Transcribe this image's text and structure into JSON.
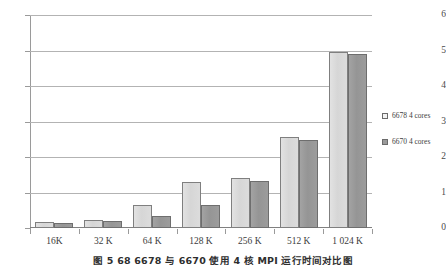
{
  "chart_data": {
    "type": "bar",
    "title": "",
    "subtitle": "",
    "xlabel": "",
    "ylabel": "",
    "ylim": [
      0,
      6
    ],
    "yticks": [
      0,
      1,
      2,
      3,
      4,
      5,
      6
    ],
    "ytick_labels": [
      "0",
      "1",
      "2",
      "3",
      "4",
      "5",
      "6"
    ],
    "grid": true,
    "legend_position": "right",
    "categories": [
      "16K",
      "32 K",
      "64 K",
      "128 K",
      "256 K",
      "512 K",
      "1 024 K"
    ],
    "series": [
      {
        "name": "6678 4 cores",
        "color": "#d9d9d9",
        "border": "#7f7f7f",
        "values": [
          0.16,
          0.22,
          0.66,
          1.29,
          1.41,
          2.56,
          4.96
        ]
      },
      {
        "name": "6670 4 cores",
        "color": "#999999",
        "border": "#6e6e6e",
        "values": [
          0.15,
          0.21,
          0.35,
          0.66,
          1.33,
          2.49,
          4.89
        ]
      }
    ]
  },
  "legend": {
    "entries": [
      {
        "label": "6678 4 cores"
      },
      {
        "label": "6670 4 cores"
      }
    ]
  },
  "caption": {
    "text": "图 5   68    6678 与 6670 使用 4       核   MPI 运行时间对比图"
  }
}
